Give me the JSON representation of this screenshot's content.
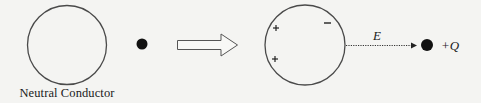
{
  "diagram": {
    "left_panel": {
      "caption": "Neutral Conductor",
      "conductor": {
        "shape": "circle",
        "state": "neutral"
      },
      "point_charge": {
        "shape": "filled-dot",
        "label": ""
      }
    },
    "transition_arrow": {
      "shape": "hollow-block-arrow",
      "direction": "right"
    },
    "right_panel": {
      "conductor": {
        "shape": "circle",
        "state": "polarized",
        "surface_charges": [
          {
            "sign": "+",
            "symbol": "+",
            "position": "upper-left"
          },
          {
            "sign": "+",
            "symbol": "+",
            "position": "lower-left"
          },
          {
            "sign": "-",
            "symbol": "−",
            "position": "upper-right"
          }
        ]
      },
      "field": {
        "label": "E",
        "style": "dotted-arrow",
        "direction": "right"
      },
      "point_charge": {
        "shape": "filled-dot",
        "label": "+Q"
      }
    },
    "colors": {
      "background": "#f4f4f2",
      "stroke": "#4a4a4a",
      "ink": "#1a1a1a"
    }
  }
}
